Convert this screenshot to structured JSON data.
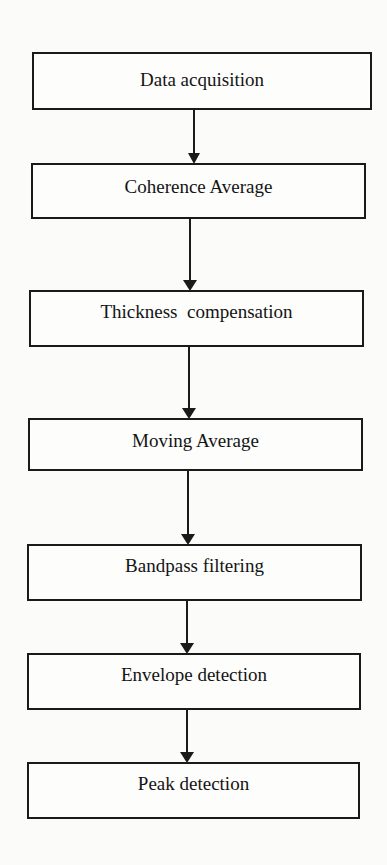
{
  "diagram": {
    "type": "flowchart",
    "direction": "top-to-bottom",
    "steps": [
      {
        "label": "Data acquisition"
      },
      {
        "label": "Coherence Average"
      },
      {
        "label": "Thickness  compensation"
      },
      {
        "label": "Moving Average"
      },
      {
        "label": "Bandpass filtering"
      },
      {
        "label": "Envelope detection"
      },
      {
        "label": "Peak detection"
      }
    ],
    "edges": [
      {
        "from": 0,
        "to": 1
      },
      {
        "from": 1,
        "to": 2
      },
      {
        "from": 2,
        "to": 3
      },
      {
        "from": 3,
        "to": 4
      },
      {
        "from": 4,
        "to": 5
      },
      {
        "from": 5,
        "to": 6
      }
    ],
    "colors": {
      "stroke": "#1a1a1a",
      "background": "#fbfbfa"
    }
  }
}
